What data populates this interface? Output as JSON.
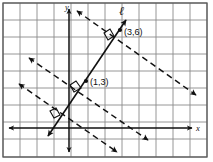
{
  "figure": {
    "kind": "coordinate-geometry-diagram",
    "background_color": "#ffffff",
    "grid_color": "#8a8a8a",
    "border_color": "#5a5a5a",
    "ink_color": "#111111",
    "grid": {
      "cell_size": 17,
      "left": 3,
      "top": 3,
      "right": 207,
      "bottom": 157,
      "columns": 12,
      "rows": 9
    },
    "axes": {
      "origin_x": 69,
      "origin_y": 128,
      "x_axis_label": "x",
      "y_axis_label": "y",
      "x_axis_label_pos": {
        "x": 199,
        "y": 131
      },
      "y_axis_label_pos": {
        "x": 66,
        "y": 9
      }
    },
    "line_label": {
      "text": "ℓ",
      "x": 121,
      "y": 14
    },
    "points": [
      {
        "label": "(3,6)",
        "dot_x": 120,
        "dot_y": 30,
        "label_x": 124,
        "label_y": 35
      },
      {
        "label": "(1,3)",
        "dot_x": 86,
        "dot_y": 81,
        "label_x": 90,
        "label_y": 85
      }
    ],
    "solid_line": {
      "name": "line-l",
      "from": {
        "x": 48,
        "y": 136
      },
      "to": {
        "x": 126,
        "y": 20
      },
      "arrow_start": true,
      "arrow_end": true
    },
    "dashed_lines": [
      {
        "name": "dashed-line-upper",
        "from": {
          "x": 77,
          "y": 11
        },
        "to": {
          "x": 196,
          "y": 95
        },
        "arrow_start": true,
        "arrow_end": true
      },
      {
        "name": "dashed-line-middle",
        "from": {
          "x": 29,
          "y": 58
        },
        "to": {
          "x": 148,
          "y": 140
        },
        "arrow_start": true,
        "arrow_end": true
      },
      {
        "name": "dashed-line-lower",
        "from": {
          "x": 19,
          "y": 84
        },
        "to": {
          "x": 117,
          "y": 152
        },
        "arrow_start": true,
        "arrow_end": true
      }
    ],
    "right_angle_marks": [
      {
        "name": "right-angle-at-3-6",
        "cx": 110,
        "cy": 37,
        "size": 9
      },
      {
        "name": "right-angle-at-1-3",
        "cx": 76,
        "cy": 88,
        "size": 9
      },
      {
        "name": "right-angle-lower-left",
        "cx": 55,
        "cy": 114,
        "size": 8
      }
    ]
  }
}
